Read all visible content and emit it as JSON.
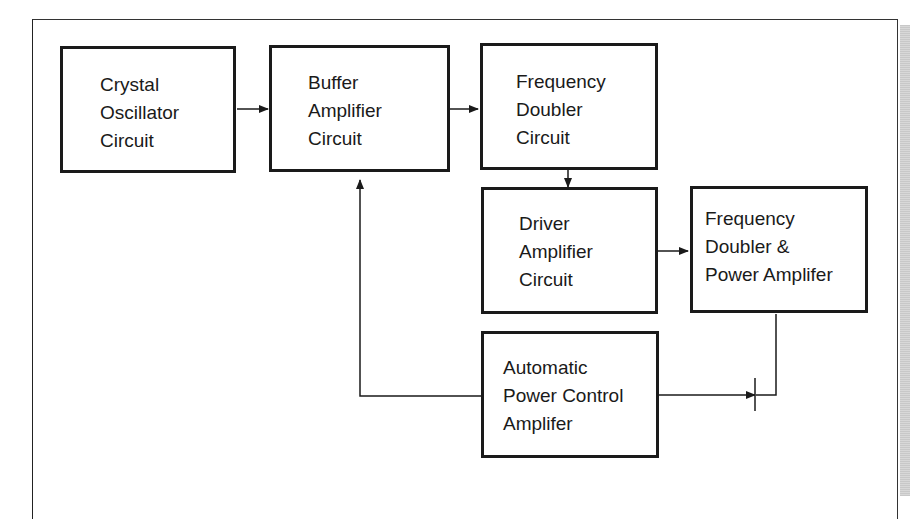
{
  "diagram": {
    "blocks": [
      {
        "id": "crystal-oscillator",
        "lines": [
          "Crystal",
          "Oscillator",
          "Circuit"
        ]
      },
      {
        "id": "buffer-amplifier",
        "lines": [
          "Buffer",
          "Amplifier",
          "Circuit"
        ]
      },
      {
        "id": "frequency-doubler",
        "lines": [
          "Frequency",
          "Doubler",
          "Circuit"
        ]
      },
      {
        "id": "driver-amplifier",
        "lines": [
          "Driver",
          "Amplifier",
          "Circuit"
        ]
      },
      {
        "id": "frequency-doubler-power-amplifier",
        "lines": [
          "Frequency",
          "Doubler &",
          "Power Amplifer"
        ]
      },
      {
        "id": "automatic-power-control",
        "lines": [
          "Automatic",
          "Power Control",
          "Amplifer"
        ]
      }
    ],
    "connections": [
      {
        "from": "crystal-oscillator",
        "to": "buffer-amplifier"
      },
      {
        "from": "buffer-amplifier",
        "to": "frequency-doubler"
      },
      {
        "from": "frequency-doubler",
        "to": "driver-amplifier"
      },
      {
        "from": "driver-amplifier",
        "to": "frequency-doubler-power-amplifier"
      },
      {
        "from": "frequency-doubler-power-amplifier",
        "to": "automatic-power-control",
        "note": "output sensed at junction"
      },
      {
        "from": "automatic-power-control",
        "to": "buffer-amplifier",
        "note": "feedback loop"
      }
    ]
  },
  "labels": {
    "b0": "Crystal\nOscillator\nCircuit",
    "b1": "Buffer\nAmplifier\nCircuit",
    "b2": "Frequency\nDoubler\nCircuit",
    "b3": "Driver\nAmplifier\nCircuit",
    "b4": "Frequency\nDoubler &\nPower Amplifer",
    "b5": "Automatic\nPower Control\nAmplifer"
  }
}
